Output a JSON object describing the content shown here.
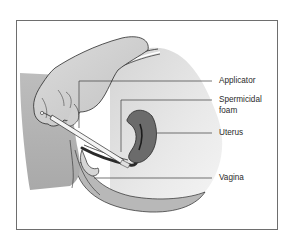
{
  "figure": {
    "type": "anatomical-illustration",
    "labels": [
      {
        "id": "applicator",
        "text": "Applicator"
      },
      {
        "id": "spermicidal-foam",
        "text": "Spermicidal",
        "text2": "foam"
      },
      {
        "id": "uterus",
        "text": "Uterus"
      },
      {
        "id": "vagina",
        "text": "Vagina"
      }
    ]
  },
  "colors": {
    "frame": "#6e6e6e",
    "skin_light": "#e6e6e6",
    "skin_mid": "#c8c8c8",
    "skin_dark": "#a8a8a8",
    "uterus": "#6b6b6b",
    "outline": "#2a2a2a",
    "leader": "#3a3a3a",
    "text": "#2a2a2a"
  }
}
